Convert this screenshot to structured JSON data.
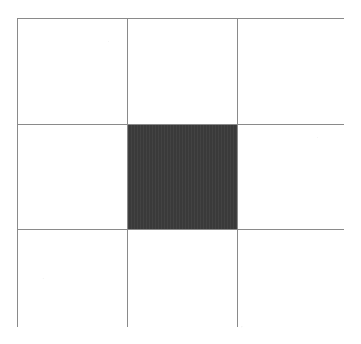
{
  "figure": {
    "name": "three-by-three-grid",
    "background_color": "#ffffff",
    "line_color": "#8a8a8a",
    "line_width_px": 1,
    "fill_color": "#3c3c3c",
    "empty_cell_color": "#ffffff",
    "rows": 3,
    "columns": 3,
    "bounds": {
      "left": 17,
      "top": 18,
      "width": 327,
      "height": 309
    }
  },
  "grid": {
    "cells": [
      {
        "id": "r1c1",
        "row": 1,
        "column": 1,
        "state": "empty",
        "fill": "#ffffff"
      },
      {
        "id": "r1c2",
        "row": 1,
        "column": 2,
        "state": "empty",
        "fill": "#ffffff"
      },
      {
        "id": "r1c3",
        "row": 1,
        "column": 3,
        "state": "empty",
        "fill": "#ffffff"
      },
      {
        "id": "r2c1",
        "row": 2,
        "column": 1,
        "state": "empty",
        "fill": "#ffffff"
      },
      {
        "id": "r2c2",
        "row": 2,
        "column": 2,
        "state": "filled",
        "fill": "#3c3c3c"
      },
      {
        "id": "r2c3",
        "row": 2,
        "column": 3,
        "state": "empty",
        "fill": "#ffffff"
      },
      {
        "id": "r3c1",
        "row": 3,
        "column": 1,
        "state": "empty",
        "fill": "#ffffff"
      },
      {
        "id": "r3c2",
        "row": 3,
        "column": 2,
        "state": "empty",
        "fill": "#ffffff"
      },
      {
        "id": "r3c3",
        "row": 3,
        "column": 3,
        "state": "empty",
        "fill": "#ffffff"
      }
    ]
  }
}
